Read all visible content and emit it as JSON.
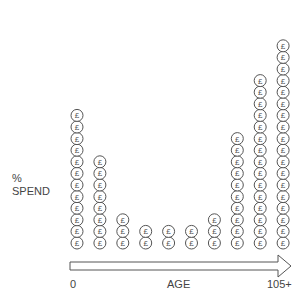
{
  "chart_data": {
    "type": "bar",
    "style": "pictogram",
    "icon": "pound-coin-icon",
    "icon_glyph": "£",
    "title": "",
    "xlabel": "AGE",
    "ylabel_line1": "%",
    "ylabel_line2": "SPEND",
    "x_start_label": "0",
    "x_end_label": "105+",
    "categories": [
      "1",
      "2",
      "3",
      "4",
      "5",
      "6",
      "7",
      "8",
      "9",
      "10"
    ],
    "values": [
      12,
      8,
      3,
      2,
      2,
      2,
      3,
      10,
      15,
      18
    ],
    "grid": false,
    "legend": "none",
    "colors": {
      "stroke": "#555555",
      "text": "#444444"
    }
  }
}
